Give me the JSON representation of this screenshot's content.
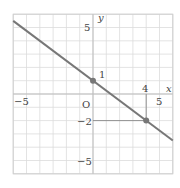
{
  "chart_data": {
    "type": "line",
    "title": "",
    "xlabel": "x",
    "ylabel": "y",
    "origin_label": "O",
    "xlim": [
      -6,
      6
    ],
    "ylim": [
      -6,
      6
    ],
    "grid": true,
    "x_tick_labels": [
      "−5",
      "4",
      "5"
    ],
    "y_tick_labels": [
      "5",
      "1",
      "−2",
      "−5"
    ],
    "series": [
      {
        "name": "line",
        "equation": "y = -3/4 x + 1",
        "slope": -0.75,
        "intercept": 1,
        "x": [
          -6,
          6
        ],
        "y": [
          5.5,
          -3.5
        ],
        "color": "#777777"
      }
    ],
    "points": [
      {
        "x": 0,
        "y": 1,
        "label": "1"
      },
      {
        "x": 4,
        "y": -2,
        "label": "4, −2"
      }
    ],
    "annotations": [
      {
        "type": "dashed-guide",
        "from": [
          0,
          -2
        ],
        "to": [
          4,
          -2
        ]
      },
      {
        "type": "dashed-guide",
        "from": [
          4,
          0
        ],
        "to": [
          4,
          -2
        ]
      }
    ]
  },
  "labels": {
    "x_axis": "x",
    "y_axis": "y",
    "origin": "O",
    "x_neg5": "−5",
    "x_4": "4",
    "x_5": "5",
    "y_5": "5",
    "y_1": "1",
    "y_neg2": "−2",
    "y_neg5": "−5"
  }
}
